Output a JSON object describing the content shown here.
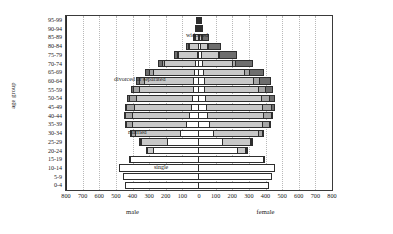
{
  "chart_data": {
    "type": "bar",
    "title": "",
    "subtitle": "",
    "orientation": "horizontal-pyramid",
    "ylabel": "age group",
    "xlabel": "",
    "grid": true,
    "legend_position": "in-plot annotations",
    "xlim": [
      -800,
      800
    ],
    "units": "thousands",
    "x_tick_labels": [
      "800",
      "700",
      "600",
      "500",
      "400",
      "300",
      "200",
      "100",
      "0",
      "100",
      "200",
      "300",
      "400",
      "500",
      "600",
      "700",
      "800"
    ],
    "x_tick_values": [
      -800,
      -700,
      -600,
      -500,
      -400,
      -300,
      -200,
      -100,
      0,
      100,
      200,
      300,
      400,
      500,
      600,
      700,
      800
    ],
    "side_labels": {
      "left": "male",
      "right": "female"
    },
    "categories": [
      "95-99",
      "90-94",
      "85-89",
      "80-84",
      "75-79",
      "70-74",
      "65-69",
      "60-64",
      "55-59",
      "50-54",
      "45-49",
      "40-44",
      "35-39",
      "30-34",
      "25-29",
      "20-24",
      "15-19",
      "10-14",
      "5-9",
      "0-4"
    ],
    "segment_names": [
      "single",
      "married",
      "divorced or separated",
      "widowed"
    ],
    "segment_colors": [
      "#ffffff",
      "#c9c9c9",
      "#a6a6a6",
      "#6e6e6e"
    ],
    "annotations": [
      {
        "text": "widowed",
        "category": "85-89",
        "side": "left"
      },
      {
        "text": "divorced or separated",
        "category": "60-64",
        "side": "left"
      },
      {
        "text": "married",
        "category": "30-34",
        "side": "left"
      },
      {
        "text": "single",
        "category": "10-14",
        "side": "left"
      }
    ],
    "series": [
      {
        "name": "male",
        "side": "left",
        "stacks": {
          "single": [
            2,
            4,
            8,
            14,
            20,
            28,
            34,
            40,
            42,
            48,
            56,
            66,
            84,
            120,
            196,
            284,
            424,
            486,
            466,
            452
          ],
          "married": [
            2,
            6,
            22,
            58,
            118,
            192,
            256,
            300,
            330,
            344,
            350,
            348,
            330,
            278,
            166,
            42,
            4,
            0,
            0,
            0
          ],
          "divorced or separated": [
            0,
            1,
            3,
            6,
            12,
            20,
            28,
            36,
            44,
            50,
            52,
            50,
            42,
            28,
            12,
            2,
            0,
            0,
            0,
            0
          ],
          "widowed": [
            1,
            3,
            9,
            18,
            26,
            32,
            32,
            28,
            20,
            14,
            10,
            6,
            4,
            2,
            1,
            0,
            0,
            0,
            0,
            0
          ]
        },
        "totals": [
          5,
          14,
          42,
          96,
          176,
          272,
          350,
          404,
          436,
          456,
          468,
          470,
          460,
          428,
          375,
          328,
          428,
          486,
          466,
          452
        ]
      },
      {
        "name": "female",
        "side": "right",
        "stacks": {
          "single": [
            4,
            8,
            14,
            20,
            26,
            32,
            36,
            40,
            42,
            46,
            52,
            60,
            72,
            96,
            152,
            238,
            398,
            462,
            444,
            430
          ],
          "married": [
            2,
            6,
            18,
            48,
            104,
            182,
            252,
            300,
            330,
            344,
            348,
            344,
            326,
            276,
            172,
            58,
            10,
            0,
            0,
            0
          ],
          "divorced or separated": [
            0,
            1,
            3,
            7,
            14,
            24,
            34,
            44,
            52,
            58,
            60,
            56,
            46,
            30,
            14,
            3,
            0,
            0,
            0,
            0
          ],
          "widowed": [
            4,
            14,
            38,
            76,
            108,
            112,
            96,
            72,
            48,
            32,
            20,
            12,
            8,
            4,
            2,
            1,
            0,
            0,
            0,
            0
          ]
        },
        "totals": [
          10,
          29,
          73,
          151,
          252,
          350,
          418,
          456,
          472,
          480,
          480,
          472,
          452,
          406,
          340,
          300,
          408,
          462,
          444,
          430
        ]
      }
    ]
  }
}
